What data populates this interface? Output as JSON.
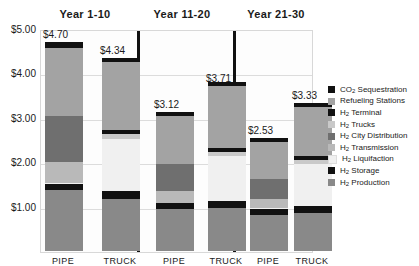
{
  "chart_data": {
    "type": "bar",
    "stacked": true,
    "title": "",
    "xlabel": "",
    "ylabel": "",
    "ylim": [
      0,
      5
    ],
    "ytick_labels": [
      "$1.00",
      "$2.00",
      "$3.00",
      "$4.00",
      "$5.00"
    ],
    "ytick_values": [
      1,
      2,
      3,
      4,
      5
    ],
    "grid": true,
    "legend_position": "right",
    "panels": [
      "Year 1-10",
      "Year 11-20",
      "Year 21-30"
    ],
    "categories": [
      "PIPE",
      "TRUCK",
      "PIPE",
      "TRUCK",
      "PIPE",
      "TRUCK"
    ],
    "totals": [
      4.7,
      4.34,
      3.12,
      3.71,
      2.53,
      3.33
    ],
    "total_labels": [
      "$4.70",
      "$4.34",
      "$3.12",
      "$3.71",
      "$2.53",
      "$3.33"
    ],
    "series": [
      {
        "name": "H2 Production",
        "color": "#898989",
        "values": [
          1.38,
          1.17,
          0.95,
          0.97,
          0.82,
          0.85
        ]
      },
      {
        "name": "H2 Storage",
        "color": "#111111",
        "values": [
          0.13,
          0.17,
          0.12,
          0.16,
          0.12,
          0.16
        ]
      },
      {
        "name": "H2 Liquifaction",
        "color": "#f0f0f0",
        "values": [
          0.02,
          1.18,
          0.02,
          1.0,
          0.02,
          0.94
        ]
      },
      {
        "name": "H2 Transmission",
        "color": "#b9b9b9",
        "values": [
          0.48,
          0.0,
          0.25,
          0.0,
          0.22,
          0.0
        ]
      },
      {
        "name": "H2 City Distribution",
        "color": "#6f6f6f",
        "values": [
          1.02,
          0.0,
          0.62,
          0.0,
          0.44,
          0.0
        ]
      },
      {
        "name": "H2 Trucks",
        "color": "#c9c9c9",
        "values": [
          0.0,
          0.11,
          0.0,
          0.1,
          0.0,
          0.09
        ]
      },
      {
        "name": "H2 Terminal",
        "color": "#111111",
        "values": [
          0.0,
          0.09,
          0.0,
          0.09,
          0.0,
          0.09
        ]
      },
      {
        "name": "Refueling Stations",
        "color": "#a3a3a3",
        "values": [
          1.54,
          1.53,
          1.08,
          1.4,
          0.83,
          1.11
        ]
      },
      {
        "name": "CO2 Sequestration",
        "color": "#111111",
        "values": [
          0.13,
          0.09,
          0.08,
          0.09,
          0.08,
          0.09
        ]
      }
    ]
  },
  "legend": {
    "items": [
      {
        "label_pre": "CO",
        "sub": "2",
        "label_post": " Sequestration",
        "color": "#111111"
      },
      {
        "label_pre": "Refueling Stations",
        "sub": "",
        "label_post": "",
        "color": "#a3a3a3"
      },
      {
        "label_pre": "H",
        "sub": "2",
        "label_post": " Terminal",
        "color": "#111111"
      },
      {
        "label_pre": "H",
        "sub": "2",
        "label_post": " Trucks",
        "color": "#c9c9c9"
      },
      {
        "label_pre": "H",
        "sub": "2",
        "label_post": " City Distribution",
        "color": "#6f6f6f"
      },
      {
        "label_pre": "H",
        "sub": "2",
        "label_post": " Transmission",
        "color": "#b9b9b9"
      },
      {
        "label_pre": "H",
        "sub": "2",
        "label_post": " Liquifaction",
        "color": "#f0f0f0"
      },
      {
        "label_pre": "H",
        "sub": "2",
        "label_post": " Storage",
        "color": "#111111"
      },
      {
        "label_pre": "H",
        "sub": "2",
        "label_post": " Production",
        "color": "#898989"
      }
    ]
  }
}
